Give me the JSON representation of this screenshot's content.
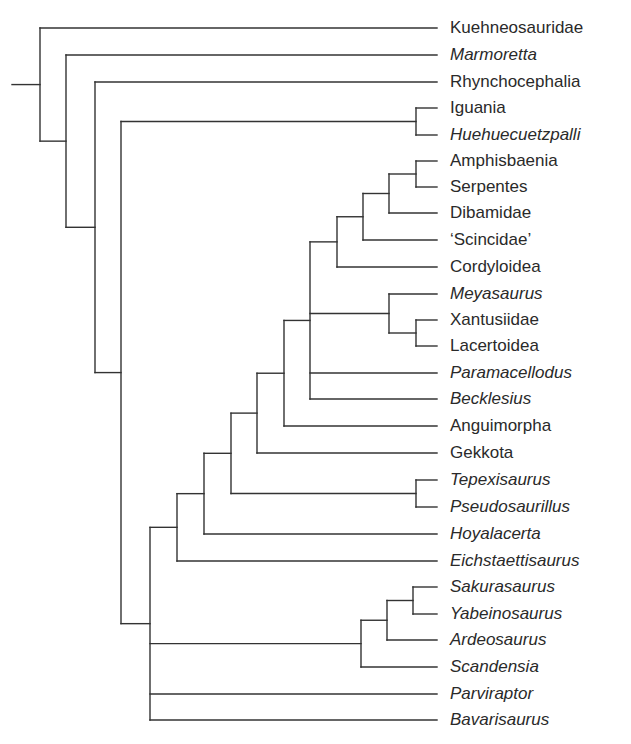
{
  "figure": {
    "type": "cladogram",
    "line_color": "#333333",
    "label_color": "#2a2a2a",
    "leaves": [
      {
        "id": "kuehneosauridae",
        "label": "Kuehneosauridae",
        "italic": false,
        "y": 28
      },
      {
        "id": "marmoretta",
        "label": "Marmoretta",
        "italic": true,
        "y": 55
      },
      {
        "id": "rhynchocephalia",
        "label": "Rhynchocephalia",
        "italic": false,
        "y": 82
      },
      {
        "id": "iguania",
        "label": "Iguania",
        "italic": false,
        "y": 108
      },
      {
        "id": "huehuecuetzpalli",
        "label": "Huehuecuetzpalli",
        "italic": true,
        "y": 135
      },
      {
        "id": "amphisbaenia",
        "label": "Amphisbaenia",
        "italic": false,
        "y": 161
      },
      {
        "id": "serpentes",
        "label": "Serpentes",
        "italic": false,
        "y": 187
      },
      {
        "id": "dibamidae",
        "label": "Dibamidae",
        "italic": false,
        "y": 213
      },
      {
        "id": "scincidae",
        "label": "‘Scincidae’",
        "italic": false,
        "y": 240
      },
      {
        "id": "cordyloidea",
        "label": "Cordyloidea",
        "italic": false,
        "y": 267
      },
      {
        "id": "meyasaurus",
        "label": "Meyasaurus",
        "italic": true,
        "y": 294
      },
      {
        "id": "xantusiidae",
        "label": "Xantusiidae",
        "italic": false,
        "y": 320
      },
      {
        "id": "lacertoidea",
        "label": "Lacertoidea",
        "italic": false,
        "y": 346
      },
      {
        "id": "paramacellodus",
        "label": "Paramacellodus",
        "italic": true,
        "y": 373
      },
      {
        "id": "becklesius",
        "label": "Becklesius",
        "italic": true,
        "y": 399
      },
      {
        "id": "anguimorpha",
        "label": "Anguimorpha",
        "italic": false,
        "y": 426
      },
      {
        "id": "gekkota",
        "label": "Gekkota",
        "italic": false,
        "y": 453
      },
      {
        "id": "tepexisaurus",
        "label": "Tepexisaurus",
        "italic": true,
        "y": 480
      },
      {
        "id": "pseudosaurillus",
        "label": "Pseudosaurillus",
        "italic": true,
        "y": 507
      },
      {
        "id": "hoyalacerta",
        "label": "Hoyalacerta",
        "italic": true,
        "y": 534
      },
      {
        "id": "eichstaettisaurus",
        "label": "Eichstaettisaurus",
        "italic": true,
        "y": 561
      },
      {
        "id": "sakurasaurus",
        "label": "Sakurasaurus",
        "italic": true,
        "y": 587
      },
      {
        "id": "yabeinosaurus",
        "label": "Yabeinosaurus",
        "italic": true,
        "y": 614
      },
      {
        "id": "ardeosaurus",
        "label": "Ardeosaurus",
        "italic": true,
        "y": 640
      },
      {
        "id": "scandensia",
        "label": "Scandensia",
        "italic": true,
        "y": 667
      },
      {
        "id": "parviraptor",
        "label": "Parviraptor",
        "italic": true,
        "y": 694
      },
      {
        "id": "bavarisaurus",
        "label": "Bavarisaurus",
        "italic": true,
        "y": 720
      }
    ],
    "tip_x": 437,
    "root_stub_x": 12,
    "tree": {
      "x": 40,
      "children": [
        "kuehneosauridae",
        {
          "x": 66,
          "children": [
            "marmoretta",
            {
              "x": 95,
              "children": [
                "rhynchocephalia",
                {
                  "x": 121,
                  "children": [
                    {
                      "x": 416,
                      "children": [
                        "iguania",
                        "huehuecuetzpalli"
                      ]
                    },
                    {
                      "x": 150,
                      "children": [
                        {
                          "x": 177,
                          "children": [
                            {
                              "x": 204,
                              "children": [
                                {
                                  "x": 231,
                                  "children": [
                                    {
                                      "x": 257,
                                      "children": [
                                        {
                                          "x": 284,
                                          "children": [
                                            {
                                              "x": 310,
                                              "children": [
                                                {
                                                  "x": 337,
                                                  "children": [
                                                    {
                                                      "x": 363,
                                                      "children": [
                                                        {
                                                          "x": 389,
                                                          "children": [
                                                            {
                                                              "x": 416,
                                                              "children": [
                                                                "amphisbaenia",
                                                                "serpentes"
                                                              ]
                                                            },
                                                            "dibamidae"
                                                          ]
                                                        },
                                                        "scincidae"
                                                      ]
                                                    },
                                                    "cordyloidea"
                                                  ]
                                                },
                                                {
                                                  "x": 389,
                                                  "children": [
                                                    "meyasaurus",
                                                    {
                                                      "x": 416,
                                                      "children": [
                                                        "xantusiidae",
                                                        "lacertoidea"
                                                      ]
                                                    }
                                                  ]
                                                },
                                                "paramacellodus",
                                                "becklesius"
                                              ]
                                            },
                                            "anguimorpha"
                                          ]
                                        },
                                        "gekkota"
                                      ]
                                    },
                                    {
                                      "x": 416,
                                      "children": [
                                        "tepexisaurus",
                                        "pseudosaurillus"
                                      ]
                                    }
                                  ]
                                },
                                "hoyalacerta"
                              ]
                            },
                            "eichstaettisaurus"
                          ]
                        },
                        {
                          "x": 361,
                          "children": [
                            {
                              "x": 387,
                              "children": [
                                {
                                  "x": 413,
                                  "children": [
                                    "sakurasaurus",
                                    "yabeinosaurus"
                                  ]
                                },
                                "ardeosaurus"
                              ]
                            },
                            "scandensia"
                          ]
                        },
                        "parviraptor",
                        "bavarisaurus"
                      ]
                    }
                  ]
                }
              ]
            }
          ]
        }
      ]
    }
  }
}
